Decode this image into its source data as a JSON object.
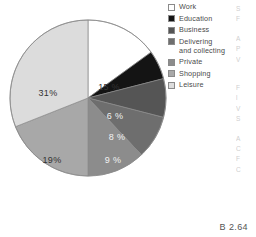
{
  "figure": {
    "caption": "B 2.64"
  },
  "legend": {
    "items": [
      {
        "label": "Work",
        "color": "#ffffff",
        "swatch_name": "legend-swatch-work"
      },
      {
        "label": "Education",
        "color": "#141414",
        "swatch_name": "legend-swatch-education"
      },
      {
        "label": "Business",
        "color": "#555555",
        "swatch_name": "legend-swatch-business"
      },
      {
        "label": "Delivering\nand collecting",
        "color": "#6e6e6e",
        "swatch_name": "legend-swatch-delivering-and-collecting"
      },
      {
        "label": "Private",
        "color": "#8c8c8c",
        "swatch_name": "legend-swatch-private"
      },
      {
        "label": "Shopping",
        "color": "#a8a8a8",
        "swatch_name": "legend-swatch-shopping"
      },
      {
        "label": "Leisure",
        "color": "#dcdcdc",
        "swatch_name": "legend-swatch-leisure"
      }
    ]
  },
  "bleed_text": [
    "S",
    "F",
    "",
    "A",
    "P",
    "V",
    "",
    "",
    "F",
    "l",
    "V",
    "S",
    "",
    "A",
    "C",
    "F",
    "C"
  ],
  "chart_data": {
    "type": "pie",
    "title": "",
    "xlabel": "",
    "ylabel": "",
    "legend_position": "right",
    "start_angle_deg": 0,
    "direction": "clockwise",
    "categories": [
      "Work",
      "Education",
      "Business",
      "Delivering and collecting",
      "Private",
      "Shopping",
      "Leisure"
    ],
    "values": [
      15,
      6,
      8,
      9,
      12,
      19,
      31
    ],
    "value_unit": "%",
    "data_labels": [
      "15 %",
      "6 %",
      "8 %",
      "9 %",
      "12 %",
      "19%",
      "31%"
    ],
    "colors": [
      "#ffffff",
      "#141414",
      "#555555",
      "#6e6e6e",
      "#8c8c8c",
      "#a8a8a8",
      "#dcdcdc"
    ],
    "label_colors": [
      "#333333",
      "#f2f2f2",
      "#f2f2f2",
      "#f2f2f2",
      "#333333",
      "#333333",
      "#333333"
    ],
    "slice_label_positions": [
      {
        "x": 101,
        "y": 72
      },
      {
        "x": 107,
        "y": 101
      },
      {
        "x": 109,
        "y": 122
      },
      {
        "x": 105,
        "y": 145
      },
      {
        "x": 76,
        "y": 167
      },
      {
        "x": 44,
        "y": 145
      },
      {
        "x": 40,
        "y": 78
      }
    ]
  }
}
